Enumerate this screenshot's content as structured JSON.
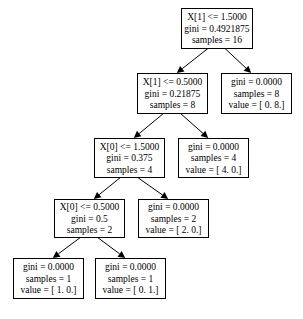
{
  "diagram": {
    "type": "decision-tree",
    "nodes": [
      {
        "id": "n0",
        "lines": [
          "X[1] <= 1.5000",
          "gini = 0.4921875",
          "samples = 16"
        ],
        "box": [
          181,
          8,
          71,
          40
        ]
      },
      {
        "id": "n1",
        "lines": [
          "X[1] <= 0.5000",
          "gini = 0.21875",
          "samples = 8"
        ],
        "box": [
          137,
          73,
          70,
          40
        ]
      },
      {
        "id": "n2",
        "lines": [
          "gini = 0.0000",
          "samples = 8",
          "value = [ 0.  8.]"
        ],
        "box": [
          221,
          73,
          70,
          40
        ]
      },
      {
        "id": "n3",
        "lines": [
          "X[0] <= 1.5000",
          "gini = 0.375",
          "samples = 4"
        ],
        "box": [
          94,
          138,
          70,
          39
        ]
      },
      {
        "id": "n4",
        "lines": [
          "gini = 0.0000",
          "samples = 4",
          "value = [ 4.  0.]"
        ],
        "box": [
          178,
          138,
          70,
          39
        ]
      },
      {
        "id": "n5",
        "lines": [
          "X[0] <= 0.5000",
          "gini = 0.5",
          "samples = 2"
        ],
        "box": [
          54,
          199,
          70,
          38
        ]
      },
      {
        "id": "n6",
        "lines": [
          "gini = 0.0000",
          "samples = 2",
          "value = [ 2.  0.]"
        ],
        "box": [
          138,
          199,
          70,
          38
        ]
      },
      {
        "id": "n7",
        "lines": [
          "gini = 0.0000",
          "samples = 1",
          "value = [ 1.  0.]"
        ],
        "box": [
          13,
          258,
          70,
          40
        ]
      },
      {
        "id": "n8",
        "lines": [
          "gini = 0.0000",
          "samples = 1",
          "value = [ 0.  1.]"
        ],
        "box": [
          95,
          258,
          70,
          40
        ]
      }
    ],
    "edges": [
      {
        "from": "n0",
        "to": "n1"
      },
      {
        "from": "n0",
        "to": "n2"
      },
      {
        "from": "n1",
        "to": "n3"
      },
      {
        "from": "n1",
        "to": "n4"
      },
      {
        "from": "n3",
        "to": "n5"
      },
      {
        "from": "n3",
        "to": "n6"
      },
      {
        "from": "n5",
        "to": "n7"
      },
      {
        "from": "n5",
        "to": "n8"
      }
    ]
  }
}
